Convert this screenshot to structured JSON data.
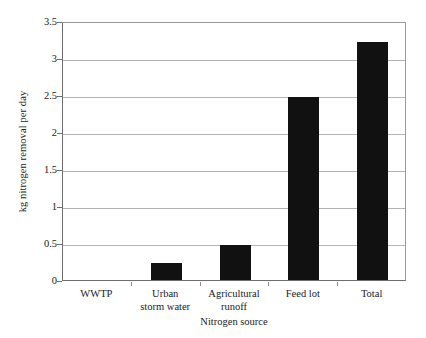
{
  "chart_data": {
    "type": "bar",
    "title": "",
    "subtitle": "",
    "categories": [
      "WWTP",
      "Urban storm water",
      "Agricultural runoff",
      "Feed lot",
      "Total"
    ],
    "category_lines": [
      [
        "WWTP"
      ],
      [
        "Urban",
        "storm water"
      ],
      [
        "Agricultural",
        "runoff"
      ],
      [
        "Feed lot"
      ],
      [
        "Total"
      ]
    ],
    "values": [
      0,
      0.23,
      0.48,
      2.48,
      3.22
    ],
    "xlabel": "Nitrogen source",
    "ylabel": "kg nitrogen removal per day",
    "ylim": [
      0,
      3.5
    ],
    "ytick_labels": [
      "0",
      "0.5",
      "1",
      "1.5",
      "2",
      "2.5",
      "3",
      "3.5"
    ],
    "ytick_values": [
      0,
      0.5,
      1,
      1.5,
      2,
      2.5,
      3,
      3.5
    ],
    "grid": "horizontal",
    "legend": "none",
    "bar_color": "#111111",
    "gridline_color": "#b4b4b4",
    "axis_color": "#6e6e6e",
    "background_color": "#ffffff"
  }
}
